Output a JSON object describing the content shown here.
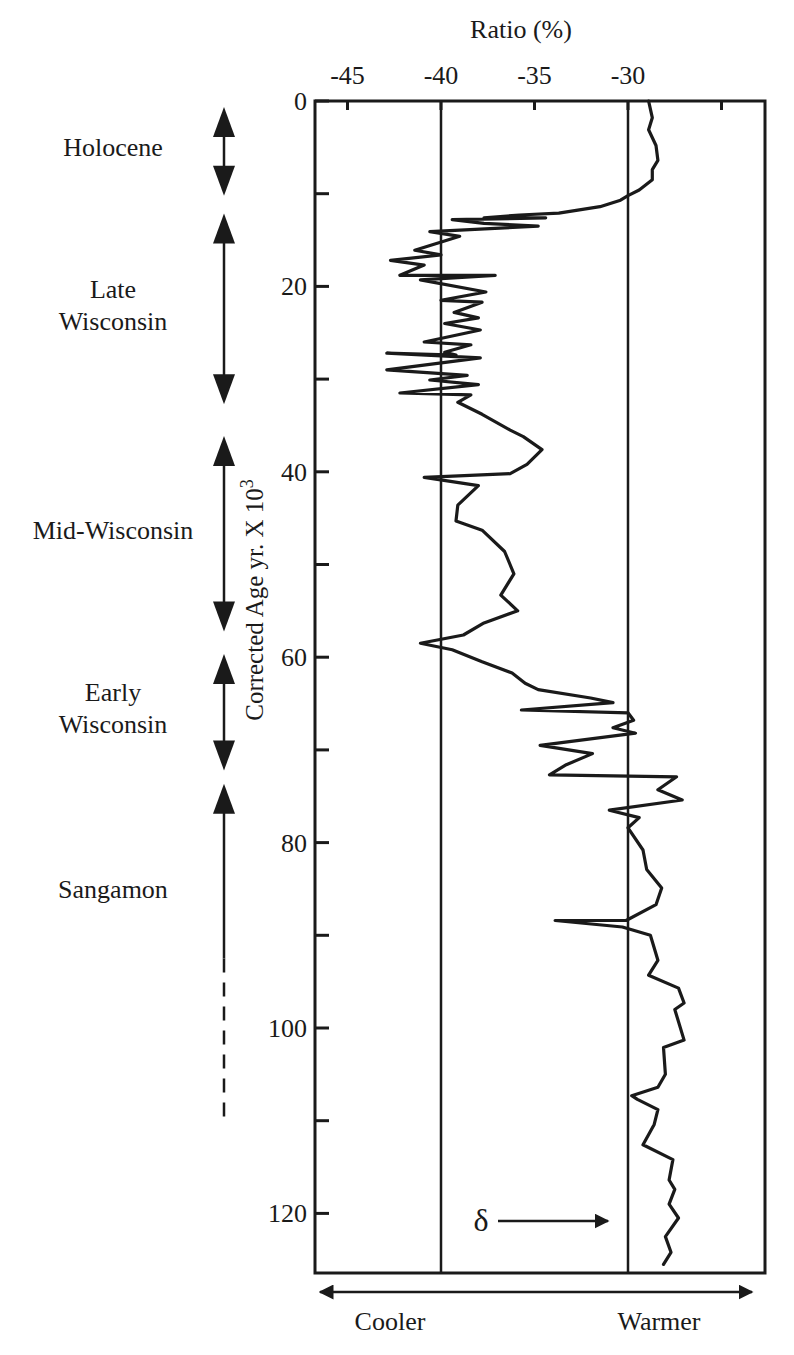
{
  "chart_data": {
    "type": "line",
    "orientation": "vertical-profile",
    "title": "",
    "xlabel": "Ratio (%)",
    "ylabel": "Corrected Age yr. X 10",
    "ylabel_superscript": "3",
    "xlim": [
      -48.5,
      -24.5
    ],
    "ylim": [
      0,
      127
    ],
    "y_inverted": true,
    "grid": false,
    "x_ticks": [
      -45,
      -40,
      -35,
      -30,
      -25
    ],
    "x_tick_labels": [
      "-45",
      "-40",
      "-35",
      "-30",
      ""
    ],
    "y_ticks": [
      0,
      10,
      20,
      30,
      40,
      50,
      60,
      70,
      80,
      90,
      100,
      110,
      120
    ],
    "y_tick_labels": [
      "0",
      "",
      "20",
      "",
      "40",
      "",
      "60",
      "",
      "80",
      "",
      "100",
      "",
      "120"
    ],
    "reference_lines_x": [
      -40,
      -30
    ],
    "series": [
      {
        "name": "delta ratio",
        "points": [
          [
            -28.9,
            0.0
          ],
          [
            -28.7,
            1.8
          ],
          [
            -28.9,
            3.1
          ],
          [
            -28.5,
            4.8
          ],
          [
            -28.4,
            6.4
          ],
          [
            -28.7,
            7.4
          ],
          [
            -28.7,
            8.5
          ],
          [
            -29.4,
            9.6
          ],
          [
            -30.0,
            10.2
          ],
          [
            -30.4,
            10.7
          ],
          [
            -31.5,
            11.4
          ],
          [
            -33.7,
            12.1
          ],
          [
            -35.8,
            12.3
          ],
          [
            -37.7,
            12.6
          ],
          [
            -34.4,
            12.6
          ],
          [
            -39.4,
            12.8
          ],
          [
            -37.7,
            13.2
          ],
          [
            -34.8,
            13.5
          ],
          [
            -40.6,
            14.1
          ],
          [
            -39.0,
            14.6
          ],
          [
            -41.4,
            16.1
          ],
          [
            -40.0,
            16.6
          ],
          [
            -42.7,
            17.2
          ],
          [
            -40.9,
            17.7
          ],
          [
            -42.2,
            18.8
          ],
          [
            -37.1,
            18.8
          ],
          [
            -41.1,
            19.3
          ],
          [
            -37.6,
            20.6
          ],
          [
            -40.0,
            21.5
          ],
          [
            -37.8,
            21.7
          ],
          [
            -39.3,
            22.8
          ],
          [
            -38.0,
            23.4
          ],
          [
            -39.8,
            24.0
          ],
          [
            -37.9,
            24.7
          ],
          [
            -40.9,
            26.0
          ],
          [
            -38.4,
            26.3
          ],
          [
            -39.8,
            27.1
          ],
          [
            -39.2,
            27.4
          ],
          [
            -42.9,
            27.2
          ],
          [
            -37.9,
            27.7
          ],
          [
            -42.9,
            29.0
          ],
          [
            -38.6,
            29.6
          ],
          [
            -40.6,
            30.1
          ],
          [
            -38.0,
            30.6
          ],
          [
            -42.2,
            31.5
          ],
          [
            -38.4,
            31.7
          ],
          [
            -39.1,
            32.5
          ],
          [
            -37.8,
            33.8
          ],
          [
            -36.3,
            35.5
          ],
          [
            -35.6,
            36.2
          ],
          [
            -34.6,
            37.6
          ],
          [
            -35.4,
            39.2
          ],
          [
            -36.3,
            40.2
          ],
          [
            -40.9,
            40.6
          ],
          [
            -38.0,
            41.5
          ],
          [
            -39.1,
            43.6
          ],
          [
            -39.2,
            45.3
          ],
          [
            -37.8,
            46.3
          ],
          [
            -36.6,
            48.6
          ],
          [
            -36.1,
            51.0
          ],
          [
            -36.8,
            53.3
          ],
          [
            -35.9,
            55.0
          ],
          [
            -37.7,
            56.3
          ],
          [
            -38.8,
            57.6
          ],
          [
            -41.1,
            58.5
          ],
          [
            -39.4,
            59.2
          ],
          [
            -37.8,
            60.5
          ],
          [
            -36.2,
            61.7
          ],
          [
            -35.5,
            62.8
          ],
          [
            -34.8,
            63.5
          ],
          [
            -32.0,
            64.4
          ],
          [
            -30.8,
            64.9
          ],
          [
            -35.7,
            65.7
          ],
          [
            -30.0,
            66.0
          ],
          [
            -29.7,
            66.8
          ],
          [
            -30.8,
            67.6
          ],
          [
            -29.6,
            68.2
          ],
          [
            -34.7,
            69.5
          ],
          [
            -31.9,
            70.4
          ],
          [
            -33.3,
            71.6
          ],
          [
            -34.2,
            72.7
          ],
          [
            -27.4,
            72.9
          ],
          [
            -28.4,
            74.3
          ],
          [
            -27.1,
            75.4
          ],
          [
            -31.0,
            76.5
          ],
          [
            -29.4,
            77.3
          ],
          [
            -30.0,
            78.4
          ],
          [
            -29.2,
            80.8
          ],
          [
            -29.0,
            82.9
          ],
          [
            -28.2,
            84.9
          ],
          [
            -28.5,
            86.7
          ],
          [
            -30.1,
            88.4
          ],
          [
            -33.9,
            88.4
          ],
          [
            -30.3,
            89.1
          ],
          [
            -28.8,
            90.0
          ],
          [
            -28.4,
            92.7
          ],
          [
            -28.9,
            94.3
          ],
          [
            -27.3,
            95.7
          ],
          [
            -27.0,
            97.3
          ],
          [
            -27.5,
            98.0
          ],
          [
            -27.0,
            101.3
          ],
          [
            -28.1,
            102.1
          ],
          [
            -28.0,
            105.0
          ],
          [
            -28.4,
            106.4
          ],
          [
            -29.8,
            107.3
          ],
          [
            -29.5,
            107.7
          ],
          [
            -28.4,
            108.8
          ],
          [
            -28.6,
            110.4
          ],
          [
            -29.2,
            112.6
          ],
          [
            -27.6,
            114.2
          ],
          [
            -27.8,
            116.4
          ],
          [
            -27.5,
            117.4
          ],
          [
            -27.8,
            119.0
          ],
          [
            -27.3,
            120.5
          ],
          [
            -28.0,
            122.5
          ],
          [
            -27.7,
            124.2
          ],
          [
            -28.1,
            125.5
          ]
        ]
      }
    ],
    "periods": [
      {
        "name": "Holocene",
        "lines": [
          "Holocene"
        ],
        "start": 0.0,
        "end": 10.0,
        "arrow_top": true,
        "arrow_bottom": true,
        "dashed_from": null
      },
      {
        "name": "Late Wisconsin",
        "lines": [
          "Late",
          "Wisconsin"
        ],
        "start": 11.5,
        "end": 32.5,
        "arrow_top": true,
        "arrow_bottom": true,
        "dashed_from": null
      },
      {
        "name": "Mid-Wisconsin",
        "lines": [
          "Mid-Wisconsin"
        ],
        "start": 35.5,
        "end": 57.0,
        "arrow_top": true,
        "arrow_bottom": true,
        "dashed_from": null
      },
      {
        "name": "Early Wisconsin",
        "lines": [
          "Early",
          "Wisconsin"
        ],
        "start": 59.0,
        "end": 72.0,
        "arrow_top": true,
        "arrow_bottom": true,
        "dashed_from": null
      },
      {
        "name": "Sangamon",
        "lines": [
          "Sangamon"
        ],
        "start": 73.0,
        "end": 110.0,
        "arrow_top": true,
        "arrow_bottom": false,
        "dashed_from": 92.5
      }
    ],
    "annotations": {
      "delta_symbol": "δ",
      "cooler_label": "Cooler",
      "warmer_label": "Warmer"
    }
  }
}
